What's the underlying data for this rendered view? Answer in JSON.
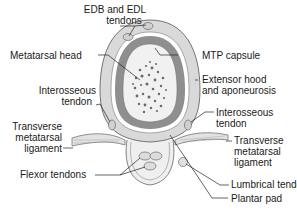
{
  "diagram": {
    "labels": {
      "edb_edl_line1": "EDB and EDL",
      "edb_edl_line2": "tendons",
      "metatarsal_head": "Metatarsal head",
      "mtp_capsule": "MTP capsule",
      "extensor_line1": "Extensor hood",
      "extensor_line2": "and aponeurosis",
      "interosseous_left_line1": "Interosseous",
      "interosseous_left_line2": "tendon",
      "interosseous_right_line1": "Interosseous",
      "interosseous_right_line2": "tendon",
      "tml_left_line1": "Transverse",
      "tml_left_line2": "metatarsal",
      "tml_left_line3": "ligament",
      "tml_right_line1": "Transverse",
      "tml_right_line2": "metatarsal",
      "tml_right_line3": "ligament",
      "flexor_tendons": "Flexor tendons",
      "lumbrical_tendon": "Lumbrical tendon",
      "plantar_pad": "Plantar pad"
    },
    "colors": {
      "outer_hood": "#d9d9d9",
      "capsule_ring": "#8f8f8f",
      "bone_fill": "#f1f1f1",
      "marrow_dots": "#6a6a6a",
      "outline": "#555555",
      "leader": "#222222"
    }
  }
}
